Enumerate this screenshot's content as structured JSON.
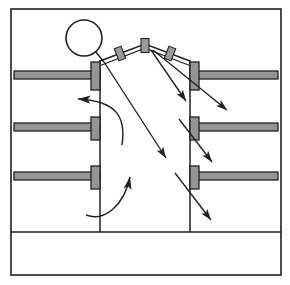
{
  "figure": {
    "type": "technical-cross-section",
    "canvas": {
      "width": 290,
      "height": 285
    },
    "colors": {
      "background": "#ffffff",
      "outline": "#231f20",
      "shelf_fill": "#949494",
      "shelf_stroke": "#231f20",
      "clamp_fill": "#9a9a9a",
      "arrow": "#231f20"
    },
    "frame": {
      "label": "outer-frame",
      "x": 11,
      "y": 9,
      "width": 270,
      "height": 266,
      "stroke_width": 1.6
    },
    "floor_line": {
      "label": "floor-line",
      "y": 232,
      "x1": 11,
      "x2": 281
    },
    "columns": {
      "left_wall_x": 100,
      "right_wall_x": 190,
      "top_y": 60,
      "bottom_y": 232,
      "label": "central-stack-walls"
    },
    "circle": {
      "label": "damper-wheel",
      "cx": 84,
      "cy": 38,
      "r": 18,
      "stroke_width": 1.6,
      "stem": {
        "x1": 95,
        "y1": 51,
        "x2": 104,
        "y2": 62
      }
    },
    "roof": {
      "label": "peaked-arch-roof",
      "points": [
        {
          "x": 100,
          "y": 61
        },
        {
          "x": 145,
          "y": 44
        },
        {
          "x": 190,
          "y": 61
        }
      ],
      "band_offset": 3,
      "clamps": [
        {
          "x": 120,
          "y": 53,
          "angle": -21,
          "w": 7,
          "h": 12
        },
        {
          "x": 145,
          "y": 45,
          "angle": 0,
          "w": 8,
          "h": 13
        },
        {
          "x": 170,
          "y": 53,
          "angle": 21,
          "w": 7,
          "h": 12
        }
      ]
    },
    "shelves_left": [
      {
        "label": "left-shelf-1",
        "y": 71,
        "height": 8,
        "x_outer": 14,
        "x_inner": 100,
        "cap_width": 9,
        "cap_top": 62,
        "cap_bottom": 90
      },
      {
        "label": "left-shelf-2",
        "y": 123,
        "height": 8,
        "x_outer": 14,
        "x_inner": 100,
        "cap_width": 9,
        "cap_top": 117,
        "cap_bottom": 140
      },
      {
        "label": "left-shelf-3",
        "y": 172,
        "height": 8,
        "x_outer": 14,
        "x_inner": 100,
        "cap_width": 9,
        "cap_top": 166,
        "cap_bottom": 189
      }
    ],
    "shelves_right": [
      {
        "label": "right-shelf-1",
        "y": 71,
        "height": 8,
        "x_inner": 190,
        "x_outer": 278,
        "cap_width": 9,
        "cap_top": 62,
        "cap_bottom": 90
      },
      {
        "label": "right-shelf-2",
        "y": 123,
        "height": 8,
        "x_inner": 190,
        "x_outer": 278,
        "cap_width": 9,
        "cap_top": 117,
        "cap_bottom": 140
      },
      {
        "label": "right-shelf-3",
        "y": 172,
        "height": 8,
        "x_inner": 190,
        "x_outer": 278,
        "cap_width": 9,
        "cap_top": 166,
        "cap_bottom": 189
      }
    ],
    "straight_arrows": [
      {
        "label": "main-downdraft-arrow",
        "x1": 104,
        "y1": 62,
        "x2": 166,
        "y2": 158
      },
      {
        "label": "right-upper-inner-arrow",
        "x1": 152,
        "y1": 50,
        "x2": 186,
        "y2": 100
      },
      {
        "label": "right-arrow-1",
        "x1": 152,
        "y1": 50,
        "x2": 228,
        "y2": 110
      },
      {
        "label": "right-arrow-2",
        "x1": 178,
        "y1": 118,
        "x2": 213,
        "y2": 163
      },
      {
        "label": "right-arrow-3",
        "x1": 174,
        "y1": 172,
        "x2": 212,
        "y2": 221
      }
    ],
    "curved_arrows": [
      {
        "label": "left-updraft-curve",
        "path": "M 122 145 C 126 118 118 101 78 99",
        "head": {
          "x": 78,
          "y": 99,
          "angle": 190
        }
      },
      {
        "label": "lower-updraft-curve",
        "path": "M 86 215 C 104 222 124 206 130 177",
        "head": {
          "x": 130,
          "y": 177,
          "angle": -76
        }
      }
    ]
  }
}
